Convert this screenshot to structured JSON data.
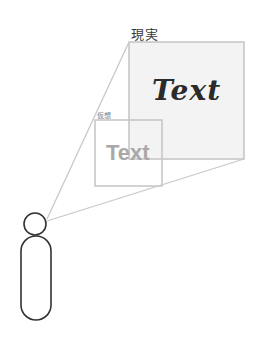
{
  "diagram": {
    "labels": {
      "reality": "現実",
      "virtual": "仮想"
    },
    "texts": {
      "reality_text": "Text",
      "virtual_text": "Text"
    },
    "colors": {
      "frame_stroke": "#c4c4c4",
      "reality_fill": "#f3f3f3",
      "person_stroke": "#333333",
      "reality_text": "#2b2b2b",
      "virtual_text": "#a8a8a8"
    },
    "shapes": {
      "reality_frame": {
        "x": 129,
        "y": 42,
        "w": 115,
        "h": 117
      },
      "virtual_frame": {
        "x": 95,
        "y": 120,
        "w": 67,
        "h": 66
      },
      "person_head": {
        "cx": 35,
        "cy": 224,
        "r": 11
      },
      "person_body": {
        "x": 21,
        "y": 236,
        "w": 30,
        "h": 84
      }
    }
  }
}
